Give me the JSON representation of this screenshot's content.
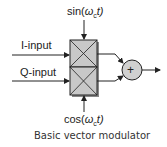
{
  "diagram": {
    "caption": "Basic vector modulator",
    "inputs": {
      "i_input": "I-input",
      "q_input": "Q-input"
    },
    "carriers": {
      "sin_prefix": "sin(",
      "sin_omega": "ω",
      "sin_sub": "c",
      "sin_suffix": "t)",
      "cos_prefix": "cos(",
      "cos_omega": "ω",
      "cos_sub": "c",
      "cos_suffix": "t)"
    },
    "summer_symbol": "+",
    "colors": {
      "mixer_fill": "#c8c8c8",
      "summer_fill": "#d0d0d0",
      "line": "#222222"
    }
  }
}
